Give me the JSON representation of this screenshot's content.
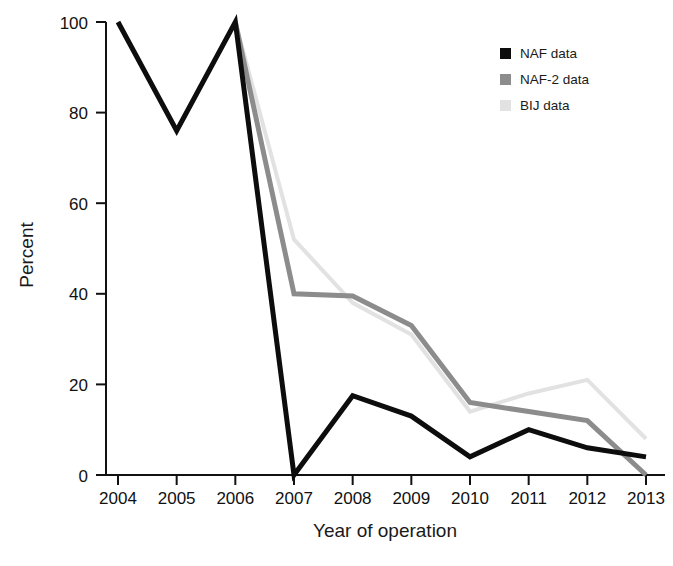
{
  "chart_data": {
    "type": "line",
    "title": "",
    "xlabel": "Year of operation",
    "ylabel": "Percent",
    "x": [
      "2004",
      "2005",
      "2006",
      "2007",
      "2008",
      "2009",
      "2010",
      "2011",
      "2012",
      "2013"
    ],
    "xlim": [
      2004,
      2013
    ],
    "ylim": [
      0,
      100
    ],
    "yticks": [
      0,
      20,
      40,
      60,
      80,
      100
    ],
    "ytick_labels": [
      "0",
      "20",
      "40",
      "60",
      "80",
      "100"
    ],
    "grid": false,
    "legend_position": "top-right",
    "series": [
      {
        "name": "NAF data",
        "color": "#0d0d0d",
        "width": 5,
        "values": [
          100,
          76,
          100,
          0,
          17.5,
          13,
          4,
          10,
          6,
          4
        ],
        "starts_at_index": 0
      },
      {
        "name": "NAF-2 data",
        "color": "#8c8c8c",
        "width": 5,
        "values": [
          null,
          null,
          100,
          40,
          39.5,
          33,
          16,
          14,
          12,
          0
        ],
        "starts_at_index": 2
      },
      {
        "name": "BIJ data",
        "color": "#e2e2e2",
        "width": 4,
        "values": [
          null,
          null,
          100,
          52,
          38,
          31,
          14,
          18,
          21,
          8
        ],
        "starts_at_index": 2
      }
    ]
  },
  "axes": {
    "y_title": "Percent",
    "x_title": "Year of operation",
    "y_ticks": [
      "100",
      "80",
      "60",
      "40",
      "20",
      "0"
    ],
    "x_ticks": [
      "2004",
      "2005",
      "2006",
      "2007",
      "2008",
      "2009",
      "2010",
      "2011",
      "2012",
      "2013"
    ]
  },
  "legend": {
    "items": [
      {
        "label": "NAF data",
        "swatch_color": "#0d0d0d"
      },
      {
        "label": "NAF-2 data",
        "swatch_color": "#8c8c8c"
      },
      {
        "label": "BIJ data",
        "swatch_color": "#e2e2e2"
      }
    ]
  }
}
